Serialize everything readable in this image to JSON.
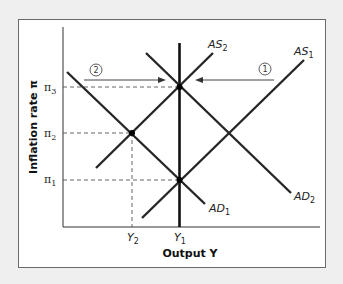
{
  "axes": {
    "y_title": "Inflation rate π",
    "x_title": "Output Y",
    "y_ticks": [
      {
        "base": "π",
        "sub": "3"
      },
      {
        "base": "π",
        "sub": "2"
      },
      {
        "base": "π",
        "sub": "1"
      }
    ],
    "x_ticks": [
      {
        "base": "Y",
        "sub": "2"
      },
      {
        "base": "Y",
        "sub": "1"
      }
    ]
  },
  "curves": {
    "as1": {
      "base": "AS",
      "sub": "1"
    },
    "as2": {
      "base": "AS",
      "sub": "2"
    },
    "ad1": {
      "base": "AD",
      "sub": "1"
    },
    "ad2": {
      "base": "AD",
      "sub": "2"
    }
  },
  "shifts": [
    {
      "step": "1",
      "direction": "left"
    },
    {
      "step": "2",
      "direction": "right"
    }
  ],
  "colors": {
    "background": "#efefef",
    "frame_fill": "#ffffff",
    "line": "#262626"
  }
}
